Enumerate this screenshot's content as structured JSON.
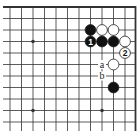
{
  "diagram": {
    "type": "go-board-fragment",
    "corner": "top-right",
    "grid": {
      "origin_x": 10,
      "origin_y": 7,
      "spacing": 11.5,
      "cols": 12,
      "rows": 12,
      "edges": {
        "top": true,
        "right": true,
        "left": false,
        "bottom": false
      }
    },
    "star_points": [
      {
        "col": 2,
        "row": 3
      },
      {
        "col": 2,
        "row": 9
      },
      {
        "col": 8,
        "row": 9
      }
    ],
    "stones": [
      {
        "color": "black",
        "col": 7,
        "row": 2,
        "label": ""
      },
      {
        "color": "white",
        "col": 8,
        "row": 2,
        "label": ""
      },
      {
        "color": "white",
        "col": 9,
        "row": 2,
        "label": ""
      },
      {
        "color": "black",
        "col": 7,
        "row": 3,
        "label": "1"
      },
      {
        "color": "black",
        "col": 8,
        "row": 3,
        "label": ""
      },
      {
        "color": "black",
        "col": 9,
        "row": 3,
        "label": ""
      },
      {
        "color": "white",
        "col": 10,
        "row": 3,
        "label": ""
      },
      {
        "color": "white",
        "col": 10,
        "row": 4,
        "label": "2"
      },
      {
        "color": "white",
        "col": 9,
        "row": 5,
        "label": ""
      },
      {
        "color": "black",
        "col": 9,
        "row": 7,
        "label": ""
      }
    ],
    "point_labels": [
      {
        "text": "a",
        "col": 8,
        "row": 5
      },
      {
        "text": "b",
        "col": 8,
        "row": 6
      }
    ],
    "colors": {
      "line": "#333333",
      "black_stone": "#111111",
      "white_stone": "#ffffff",
      "stone_outline": "#222222",
      "background": "#ffffff"
    }
  }
}
